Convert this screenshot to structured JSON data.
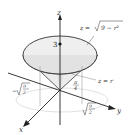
{
  "diagram": {
    "type": "3d-surface-region",
    "axes": {
      "x": "x",
      "y": "y",
      "z": "z"
    },
    "labels": {
      "sphere": "z = √9 − r²",
      "sphere_prefix": "z = ",
      "sphere_radicand": "9 − r²",
      "cone": "z = r",
      "height": "3",
      "angle_num": "π",
      "angle_den": "4",
      "neg_radius_sign": "−",
      "radius_num": "9",
      "radius_den": "2"
    },
    "colors": {
      "surface_fill": "#e6e6e6",
      "surface_edge": "#333333",
      "axis": "#222222",
      "guide": "#999999"
    }
  }
}
